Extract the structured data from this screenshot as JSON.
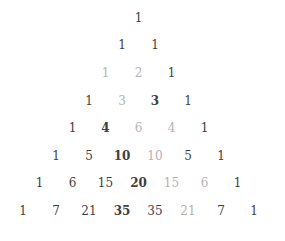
{
  "figure": {
    "background": "#ffffff"
  },
  "colors": {
    "dark": "#3f3f3f",
    "gray": "#b3b3b3"
  },
  "triangle": {
    "rows": [
      [
        {
          "value": "1",
          "tone": "dark",
          "weight": "normal"
        }
      ],
      [
        {
          "value": "1",
          "tone": "dark",
          "weight": "normal"
        },
        {
          "value": "1",
          "tone": "dark",
          "weight": "normal"
        }
      ],
      [
        {
          "value": "1",
          "tone": "gray",
          "weight": "normal"
        },
        {
          "value": "2",
          "tone": "gray",
          "weight": "normal"
        },
        {
          "value": "1",
          "tone": "dark",
          "weight": "normal"
        }
      ],
      [
        {
          "value": "1",
          "tone": "dark",
          "weight": "normal"
        },
        {
          "value": "3",
          "tone": "gray",
          "weight": "normal"
        },
        {
          "value": "3",
          "tone": "dark",
          "weight": "bold"
        },
        {
          "value": "1",
          "tone": "dark",
          "weight": "normal"
        }
      ],
      [
        {
          "value": "1",
          "tone": "dark",
          "weight": "normal"
        },
        {
          "value": "4",
          "tone": "dark",
          "weight": "bold"
        },
        {
          "value": "6",
          "tone": "gray",
          "weight": "normal"
        },
        {
          "value": "4",
          "tone": "gray",
          "weight": "normal"
        },
        {
          "value": "1",
          "tone": "dark",
          "weight": "normal"
        }
      ],
      [
        {
          "value": "1",
          "tone": "dark",
          "weight": "normal"
        },
        {
          "value": "5",
          "tone": "dark",
          "weight": "normal"
        },
        {
          "value": "10",
          "tone": "dark",
          "weight": "bold"
        },
        {
          "value": "10",
          "tone": "gray",
          "weight": "normal"
        },
        {
          "value": "5",
          "tone": "dark",
          "weight": "normal"
        },
        {
          "value": "1",
          "tone": "dark",
          "weight": "normal"
        }
      ],
      [
        {
          "value": "1",
          "tone": "dark",
          "weight": "normal"
        },
        {
          "value": "6",
          "tone": "dark",
          "weight": "normal"
        },
        {
          "value": "15",
          "tone": "dark",
          "weight": "normal"
        },
        {
          "value": "20",
          "tone": "dark",
          "weight": "bold"
        },
        {
          "value": "15",
          "tone": "gray",
          "weight": "normal"
        },
        {
          "value": "6",
          "tone": "gray",
          "weight": "normal"
        },
        {
          "value": "1",
          "tone": "dark",
          "weight": "normal"
        }
      ],
      [
        {
          "value": "1",
          "tone": "dark",
          "weight": "normal"
        },
        {
          "value": "7",
          "tone": "dark",
          "weight": "normal"
        },
        {
          "value": "21",
          "tone": "dark",
          "weight": "normal"
        },
        {
          "value": "35",
          "tone": "dark",
          "weight": "bold"
        },
        {
          "value": "35",
          "tone": "dark",
          "weight": "normal"
        },
        {
          "value": "21",
          "tone": "gray",
          "weight": "normal"
        },
        {
          "value": "7",
          "tone": "dark",
          "weight": "normal"
        },
        {
          "value": "1",
          "tone": "dark",
          "weight": "normal"
        }
      ]
    ]
  }
}
